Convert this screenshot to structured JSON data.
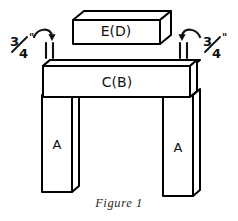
{
  "figure": {
    "caption": "Figure 1",
    "parts": [
      {
        "id": "top-block",
        "label": "E(D)",
        "name": "part-block-e-d"
      },
      {
        "id": "cross-beam",
        "label": "C(B)",
        "name": "part-beam-c-b"
      },
      {
        "id": "left-leg",
        "label": "A",
        "name": "part-leg-left-a"
      },
      {
        "id": "right-leg",
        "label": "A",
        "name": "part-leg-right-a"
      }
    ],
    "dimensions": [
      {
        "id": "left-gap",
        "value": "3",
        "denominator": "4",
        "unit": "\"",
        "full": "3/4\""
      },
      {
        "id": "right-gap",
        "value": "3",
        "denominator": "4",
        "unit": "\"",
        "full": "3/4\""
      }
    ],
    "colors": {
      "ink": "#111111",
      "outline": "#000000",
      "fill": "#ffffff",
      "background": "#ffffff",
      "caption": "#2a2a2a"
    }
  }
}
